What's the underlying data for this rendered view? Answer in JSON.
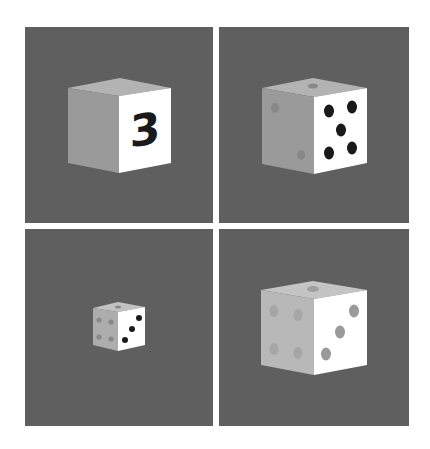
{
  "layout": {
    "rows": 2,
    "cols": 2
  },
  "colors": {
    "page_background": "#ffffff",
    "panel_background": "#5f5f5f",
    "top_face": "#b3b3b3",
    "left_face": "#9a9a9a",
    "right_face": "#ffffff",
    "pip_dark": "#1a1a1a",
    "pip_faded": "#8e8e8e"
  },
  "panels": [
    {
      "position": "top-left",
      "description": "Cube with numeral on front-right face",
      "right_face_label": "3",
      "right_face_pips": 0,
      "top_face_pips": 0,
      "left_face_pips": 0,
      "pip_style": "none"
    },
    {
      "position": "top-right",
      "description": "Die showing five dark pips on front-right face",
      "right_face_label": "",
      "right_face_pips": 5,
      "top_face_pips": 1,
      "left_face_pips": 2,
      "pip_style": "dark"
    },
    {
      "position": "bottom-left",
      "description": "Small die showing three dark pips on front-right face",
      "right_face_label": "",
      "right_face_pips": 3,
      "top_face_pips": 1,
      "left_face_pips": 4,
      "pip_style": "dark"
    },
    {
      "position": "bottom-right",
      "description": "Large die with faded gray pips, three on front-right face",
      "right_face_label": "",
      "right_face_pips": 3,
      "top_face_pips": 1,
      "left_face_pips": 4,
      "pip_style": "faded"
    }
  ]
}
